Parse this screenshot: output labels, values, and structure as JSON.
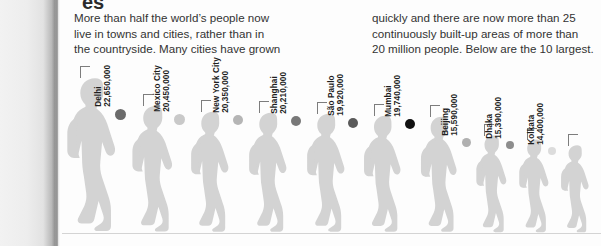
{
  "headline_fragment": "es",
  "intro": {
    "column_1": [
      "More than half the world’s people now",
      "live in towns and cities, rather than in",
      "the countryside. Many cities have grown"
    ],
    "column_2": [
      "quickly and there are now more than 25",
      "continuously built-up areas of more than",
      "20 million people. Below are the 10 largest."
    ]
  },
  "colors": {
    "figure_fill": "#d3d3d3",
    "baseline": "#d4d4d4",
    "leader_line": "#7d7d7d",
    "label_text": "#1f1f1f",
    "body_text": "#333333"
  },
  "chart_data": {
    "type": "bar",
    "xlabel": "",
    "ylabel": "Population",
    "categories": [
      "Tokyo",
      "Delhi",
      "Mexico City",
      "New York City",
      "Shanghai",
      "São Paulo",
      "Mumbai",
      "Beijing",
      "Dhaka",
      "Kolkata"
    ],
    "values": [
      37220000,
      22650000,
      20450000,
      20350000,
      20210000,
      19920000,
      19740000,
      15590000,
      15390000,
      14400000
    ],
    "value_labels": [
      "37,220,000",
      "22,650,000",
      "20,450,000",
      "20,350,000",
      "20,210,000",
      "19,920,000",
      "19,740,000",
      "15,590,000",
      "15,390,000",
      "14,400,000"
    ],
    "dot_colors": [
      "#4a4a4a",
      "#6b6b6b",
      "#c9c9c9",
      "#b5b5b5",
      "#787878",
      "#5a5a5a",
      "#111111",
      "#b0b0b0",
      "#8d8d8d",
      "#dcdcdc"
    ],
    "ylim": [
      0,
      37220000
    ],
    "grid": false,
    "legend": "none"
  },
  "cities": [
    {
      "name": "Tokyo",
      "population": "37,220,000",
      "dot": "#4a4a4a",
      "x": 62,
      "figure_height": 158,
      "label_bottom": 160,
      "label_left": 16
    },
    {
      "name": "Delhi",
      "population": "22,650,000",
      "dot": "#6b6b6b",
      "x": 128,
      "figure_height": 130,
      "label_bottom": 132,
      "label_left": 16
    },
    {
      "name": "Mexico City",
      "population": "20,450,000",
      "dot": "#c9c9c9",
      "x": 187,
      "figure_height": 124,
      "label_bottom": 126,
      "label_left": 16
    },
    {
      "name": "New York City",
      "population": "20,350,000",
      "dot": "#b5b5b5",
      "x": 245,
      "figure_height": 123,
      "label_bottom": 125,
      "label_left": 16
    },
    {
      "name": "Shanghai",
      "population": "20,210,000",
      "dot": "#787878",
      "x": 303,
      "figure_height": 122,
      "label_bottom": 124,
      "label_left": 16
    },
    {
      "name": "São Paulo",
      "population": "19,920,000",
      "dot": "#5a5a5a",
      "x": 360,
      "figure_height": 120,
      "label_bottom": 122,
      "label_left": 16
    },
    {
      "name": "Mumbai",
      "population": "19,740,000",
      "dot": "#111111",
      "x": 417,
      "figure_height": 119,
      "label_bottom": 121,
      "label_left": 16
    },
    {
      "name": "Beijing",
      "population": "15,590,000",
      "dot": "#b0b0b0",
      "x": 473,
      "figure_height": 100,
      "label_bottom": 102,
      "label_left": 16
    },
    {
      "name": "Dhaka",
      "population": "15,390,000",
      "dot": "#8d8d8d",
      "x": 516,
      "figure_height": 96,
      "label_bottom": 98,
      "label_left": 16
    },
    {
      "name": "Kolkata",
      "population": "14,400,000",
      "dot": "#dcdcdc",
      "x": 558,
      "figure_height": 90,
      "label_bottom": 92,
      "label_left": 16
    }
  ]
}
